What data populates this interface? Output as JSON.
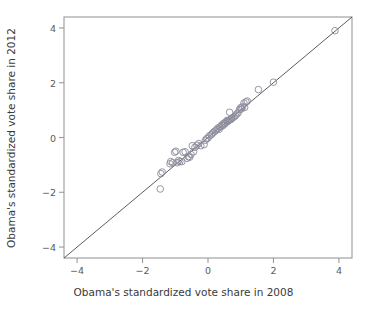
{
  "chart_data": {
    "type": "scatter",
    "title": "",
    "xlabel": "Obama's standardized vote share in 2008",
    "ylabel": "Obama's standardized vote share in 2012",
    "xlim": [
      -4.4,
      4.4
    ],
    "ylim": [
      -4.4,
      4.4
    ],
    "xticks": [
      -4,
      -2,
      0,
      2,
      4
    ],
    "yticks": [
      -4,
      -2,
      0,
      2,
      4
    ],
    "xtick_labels": [
      "−4",
      "−2",
      "0",
      "2",
      "4"
    ],
    "ytick_labels": [
      "−4",
      "−2",
      "0",
      "2",
      "4"
    ],
    "grid": false,
    "legend": null,
    "marker": "open-circle",
    "marker_color": "#8a8a9a",
    "marker_size": 4.4,
    "reference_line": {
      "type": "identity",
      "label": "y = x",
      "from": [
        -4.4,
        -4.4
      ],
      "to": [
        4.4,
        4.4
      ],
      "color": "#4a4a4a"
    },
    "points": [
      [
        3.88,
        3.9
      ],
      [
        2.0,
        2.02
      ],
      [
        1.54,
        1.75
      ],
      [
        1.2,
        1.33
      ],
      [
        1.16,
        1.3
      ],
      [
        1.1,
        1.26
      ],
      [
        1.06,
        1.12
      ],
      [
        1.12,
        1.1
      ],
      [
        1.0,
        1.09
      ],
      [
        1.02,
        1.04
      ],
      [
        0.96,
        1.02
      ],
      [
        0.66,
        0.92
      ],
      [
        0.92,
        0.9
      ],
      [
        0.88,
        0.86
      ],
      [
        0.84,
        0.8
      ],
      [
        0.8,
        0.76
      ],
      [
        0.76,
        0.72
      ],
      [
        0.72,
        0.7
      ],
      [
        0.7,
        0.66
      ],
      [
        0.66,
        0.64
      ],
      [
        0.62,
        0.62
      ],
      [
        0.6,
        0.58
      ],
      [
        0.58,
        0.62
      ],
      [
        0.54,
        0.56
      ],
      [
        0.52,
        0.5
      ],
      [
        0.48,
        0.52
      ],
      [
        0.46,
        0.44
      ],
      [
        0.42,
        0.46
      ],
      [
        0.4,
        0.4
      ],
      [
        0.36,
        0.38
      ],
      [
        0.34,
        0.3
      ],
      [
        0.3,
        0.34
      ],
      [
        0.26,
        0.28
      ],
      [
        0.22,
        0.24
      ],
      [
        0.18,
        0.2
      ],
      [
        0.14,
        0.16
      ],
      [
        0.1,
        0.1
      ],
      [
        0.04,
        0.06
      ],
      [
        0.0,
        -0.02
      ],
      [
        -0.04,
        -0.04
      ],
      [
        -0.08,
        -0.1
      ],
      [
        -0.12,
        -0.26
      ],
      [
        -0.22,
        -0.3
      ],
      [
        -0.28,
        -0.22
      ],
      [
        -0.34,
        -0.28
      ],
      [
        -0.4,
        -0.36
      ],
      [
        -0.44,
        -0.52
      ],
      [
        -0.48,
        -0.3
      ],
      [
        -0.52,
        -0.62
      ],
      [
        -0.56,
        -0.72
      ],
      [
        -0.6,
        -0.7
      ],
      [
        -0.64,
        -0.76
      ],
      [
        -0.7,
        -0.52
      ],
      [
        -0.76,
        -0.54
      ],
      [
        -0.8,
        -0.88
      ],
      [
        -0.86,
        -0.88
      ],
      [
        -0.9,
        -0.84
      ],
      [
        -0.94,
        -0.92
      ],
      [
        -0.98,
        -0.5
      ],
      [
        -1.02,
        -0.54
      ],
      [
        -1.08,
        -0.92
      ],
      [
        -1.14,
        -0.88
      ],
      [
        -1.16,
        -0.96
      ],
      [
        -1.4,
        -1.26
      ],
      [
        -1.44,
        -1.32
      ],
      [
        -1.46,
        -1.88
      ]
    ]
  },
  "axes": {
    "plot_left_px": 64,
    "plot_right_px": 352,
    "plot_top_px": 17,
    "plot_bottom_px": 258
  }
}
